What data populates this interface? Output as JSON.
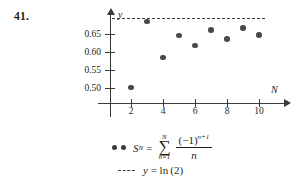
{
  "problem": {
    "number": "41."
  },
  "chart_data": {
    "type": "scatter",
    "title": "",
    "xlabel": "N",
    "ylabel": "y",
    "x": [
      2,
      3,
      4,
      5,
      6,
      7,
      8,
      9,
      10
    ],
    "values": [
      0.5,
      0.683,
      0.583,
      0.645,
      0.617,
      0.66,
      0.635,
      0.665,
      0.646
    ],
    "series": [
      {
        "name": "S_N",
        "marker": "filled-circle",
        "color": "#4a4a4a",
        "values": [
          0.5,
          0.683,
          0.583,
          0.645,
          0.617,
          0.66,
          0.635,
          0.665,
          0.646
        ]
      },
      {
        "name": "y = ln(2)",
        "marker": "dashed-line",
        "color": "#3b3b3b",
        "constant": 0.6931
      }
    ],
    "xticks": [
      2,
      4,
      6,
      8,
      10
    ],
    "xtick_labels": [
      "2",
      "4",
      "6",
      "8",
      "10"
    ],
    "yticks": [
      0.5,
      0.55,
      0.6,
      0.65
    ],
    "ytick_labels": [
      "0.50",
      "0.55",
      "0.60",
      "0.65"
    ],
    "xlim": [
      0,
      11
    ],
    "ylim": [
      0.455,
      0.7
    ],
    "grid": false,
    "legend_position": "below"
  },
  "axes": {
    "y_axis_label": "y",
    "x_axis_label": "N",
    "y_tick_labels": [
      "0.65",
      "0.60",
      "0.55",
      "0.50"
    ],
    "x_tick_labels": [
      "2",
      "4",
      "6",
      "8",
      "10"
    ]
  },
  "legend": {
    "series_formula": {
      "lhs": "S",
      "lhs_sub": "N",
      "equals": "=",
      "sigma_upper": "N",
      "sigma_glyph": "∑",
      "sigma_lower": "n=1",
      "numerator": "(−1)",
      "numerator_exponent": "n+1",
      "denominator": "n"
    },
    "ln2_entry": "y = ln (2)"
  },
  "colors": {
    "point": "#4a4a4a",
    "axis": "#3b3b3b",
    "text": "#231f20",
    "background": "#ffffff"
  }
}
